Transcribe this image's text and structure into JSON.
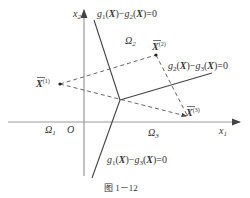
{
  "figure": {
    "caption": "图 1－12",
    "axes": {
      "x_label": "x",
      "x_sub": "1",
      "y_label": "x",
      "y_sub": "2",
      "origin": "O"
    },
    "regions": {
      "omega1": {
        "sym": "Ω",
        "sub": "1"
      },
      "omega2": {
        "sym": "Ω",
        "sub": "2"
      },
      "omega3": {
        "sym": "Ω",
        "sub": "3"
      }
    },
    "boundaries": {
      "b12": {
        "g_a": "g",
        "a_sub": "1",
        "g_b": "g",
        "b_sub": "2",
        "X": "X",
        "eq": "=0"
      },
      "b23": {
        "g_a": "g",
        "a_sub": "2",
        "g_b": "g",
        "b_sub": "3",
        "X": "X",
        "eq": "=0"
      },
      "b13": {
        "g_a": "g",
        "a_sub": "1",
        "g_b": "g",
        "b_sub": "3",
        "X": "X",
        "eq": "=0"
      }
    },
    "points": {
      "p1": {
        "sym": "X",
        "sup": "(1)"
      },
      "p2": {
        "sym": "X",
        "sup": "(2)"
      },
      "p3": {
        "sym": "X",
        "sup": "(3)"
      }
    },
    "colors": {
      "axis": "#999999",
      "line": "#444444",
      "dashed": "#555555",
      "text": "#333333"
    }
  }
}
